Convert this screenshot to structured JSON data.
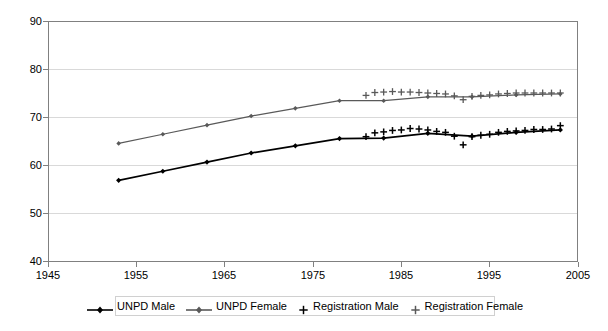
{
  "chart_data": {
    "type": "line",
    "title": "",
    "subtitle": "",
    "xlabel": "",
    "ylabel": "",
    "xlim": [
      1945,
      2005
    ],
    "ylim": [
      40,
      90
    ],
    "x_ticks": [
      1945,
      1955,
      1965,
      1975,
      1985,
      1995,
      2005
    ],
    "y_ticks": [
      40,
      50,
      60,
      70,
      80,
      90
    ],
    "grid": "horizontal",
    "legend_position": "bottom",
    "series": [
      {
        "name": "UNPD Male",
        "marker": "diamond",
        "color": "#000000",
        "style": "line-with-markers",
        "x": [
          1953,
          1958,
          1963,
          1968,
          1973,
          1978,
          1983,
          1988,
          1993,
          1998,
          2003
        ],
        "values": [
          56.8,
          58.7,
          60.6,
          62.5,
          64.0,
          65.5,
          65.6,
          66.6,
          66.0,
          66.8,
          67.3
        ]
      },
      {
        "name": "UNPD Female",
        "marker": "diamond",
        "color": "#595959",
        "style": "line-with-markers",
        "x": [
          1953,
          1958,
          1963,
          1968,
          1973,
          1978,
          1983,
          1988,
          1993,
          1998,
          2003
        ],
        "values": [
          64.5,
          66.4,
          68.3,
          70.2,
          71.8,
          73.4,
          73.4,
          74.2,
          74.2,
          74.6,
          74.8
        ]
      },
      {
        "name": "Registration Male",
        "marker": "plus",
        "color": "#000000",
        "style": "markers-only",
        "x": [
          1981,
          1982,
          1983,
          1984,
          1985,
          1986,
          1987,
          1988,
          1989,
          1990,
          1991,
          1992,
          1993,
          1994,
          1995,
          1996,
          1997,
          1998,
          1999,
          2000,
          2001,
          2002,
          2003
        ],
        "values": [
          65.9,
          66.7,
          66.9,
          67.2,
          67.3,
          67.6,
          67.5,
          67.3,
          67.0,
          66.8,
          66.0,
          64.2,
          65.9,
          66.2,
          66.4,
          66.8,
          67.0,
          67.1,
          67.2,
          67.4,
          67.4,
          67.5,
          68.2
        ]
      },
      {
        "name": "Registration Female",
        "marker": "plus",
        "color": "#595959",
        "style": "markers-only",
        "x": [
          1981,
          1982,
          1983,
          1984,
          1985,
          1986,
          1987,
          1988,
          1989,
          1990,
          1991,
          1992,
          1993,
          1994,
          1995,
          1996,
          1997,
          1998,
          1999,
          2000,
          2001,
          2002,
          2003
        ],
        "values": [
          74.5,
          75.1,
          75.2,
          75.3,
          75.2,
          75.2,
          75.1,
          75.0,
          74.9,
          74.8,
          74.4,
          73.6,
          74.3,
          74.5,
          74.6,
          74.8,
          74.9,
          75.0,
          75.0,
          75.0,
          75.0,
          75.0,
          75.0
        ]
      }
    ]
  },
  "axes": {
    "y_tick_labels": [
      "90",
      "80",
      "70",
      "60",
      "50",
      "40"
    ],
    "x_tick_labels": [
      "1945",
      "1955",
      "1965",
      "1975",
      "1985",
      "1995",
      "2005"
    ]
  },
  "legend": {
    "items": [
      {
        "label": "UNPD Male",
        "marker": "diamond-line",
        "color": "#000000"
      },
      {
        "label": "UNPD Female",
        "marker": "diamond-line",
        "color": "#595959"
      },
      {
        "label": "Registration Male",
        "marker": "plus",
        "color": "#000000"
      },
      {
        "label": "Registration Female",
        "marker": "plus",
        "color": "#595959"
      }
    ]
  },
  "colors": {
    "frame": "#808080",
    "grid": "#d9d9d9",
    "male": "#000000",
    "female": "#595959",
    "background": "#ffffff"
  }
}
